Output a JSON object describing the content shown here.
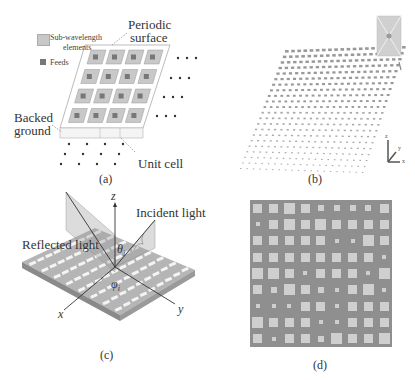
{
  "panels": {
    "a": {
      "caption": "(a)",
      "legend": [
        {
          "label_line1": "Sub-wavelength",
          "label_line2": "elements",
          "swatch": "#c8c8c8"
        },
        {
          "label_line1": "Feeds",
          "swatch": "#777777"
        }
      ],
      "labels": {
        "periodic_line1": "Periodic",
        "periodic_line2": "surface",
        "backed_line1": "Backed",
        "backed_line2": "ground",
        "unit_cell": "Unit cell"
      }
    },
    "b": {
      "caption": "(b)",
      "axes": {
        "z": "z",
        "y": "y",
        "x": "x"
      }
    },
    "c": {
      "caption": "(c)",
      "labels": {
        "incident": "Incident light",
        "reflected": "Reflected light",
        "z": "z",
        "x": "x",
        "y": "y",
        "theta": "θ",
        "theta_sub": "i",
        "phi": "φ",
        "phi_sub": "i"
      }
    },
    "d": {
      "caption": "(d)",
      "grid_sizes": [
        [
          3,
          3,
          4,
          3,
          2,
          2,
          2,
          2,
          3
        ],
        [
          1,
          3,
          4,
          3,
          4,
          3,
          3,
          3,
          3
        ],
        [
          3,
          3,
          3,
          3,
          3,
          1,
          1,
          4,
          3
        ],
        [
          3,
          3,
          3,
          3,
          3,
          3,
          3,
          3,
          1
        ],
        [
          4,
          4,
          3,
          1,
          3,
          3,
          3,
          1,
          4
        ],
        [
          3,
          2,
          4,
          3,
          2,
          1,
          3,
          4,
          1
        ],
        [
          1,
          1,
          1,
          3,
          3,
          1,
          3,
          3,
          3
        ],
        [
          4,
          3,
          3,
          3,
          1,
          1,
          3,
          3,
          3
        ],
        [
          3,
          1,
          3,
          3,
          2,
          4,
          3,
          3,
          4
        ]
      ]
    }
  },
  "colors": {
    "element": "#c8c8c8",
    "feed": "#777777",
    "substrate_d": "#8f8f8f",
    "square_d": "#cfcfcf"
  }
}
